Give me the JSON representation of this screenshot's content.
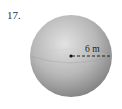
{
  "problem": {
    "number": "17."
  },
  "figure": {
    "shape": "sphere",
    "radius_label": "6 m",
    "colors": {
      "sphere_light": "#d4d4d4",
      "sphere_dark": "#8a8a8a",
      "line": "#111111"
    }
  }
}
